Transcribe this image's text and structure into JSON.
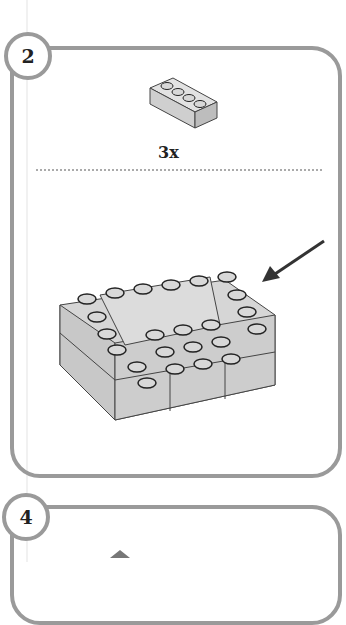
{
  "steps": [
    {
      "number": "2",
      "parts": [
        {
          "part": "1x4 brick",
          "quantity": "3x"
        }
      ],
      "callout": "arrow-pointing-to-added-bricks"
    },
    {
      "number": "4"
    }
  ],
  "colors": {
    "frame": "#9a9a9a",
    "brick": "#d4d4d4",
    "stud_dark": "#222222"
  }
}
